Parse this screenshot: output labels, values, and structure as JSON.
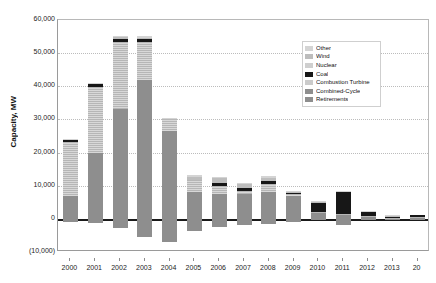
{
  "chart_data": {
    "type": "bar",
    "title": "",
    "subtitle": "",
    "xlabel": "",
    "ylabel": "Capacity, MW",
    "stacked": true,
    "grid": true,
    "legend_position": "top-right",
    "ylim": [
      -10000,
      60000
    ],
    "yticks": [
      60000,
      50000,
      40000,
      30000,
      20000,
      10000,
      0,
      -10000
    ],
    "ytick_labels": [
      "60,000",
      "50,000",
      "40,000",
      "30,000",
      "20,000",
      "10,000",
      "0",
      "(10,000)"
    ],
    "categories": [
      "2000",
      "2001",
      "2002",
      "2003",
      "2004",
      "2005",
      "2006",
      "2007",
      "2008",
      "2009",
      "2010",
      "2011",
      "2012",
      "2013",
      "20"
    ],
    "series": [
      {
        "name": "Combined-Cycle",
        "color": "#8e8e8e",
        "values": [
          7000,
          19800,
          33000,
          42000,
          26500,
          8200,
          7600,
          7400,
          8200,
          7000,
          1800,
          1200,
          700,
          300,
          400
        ]
      },
      {
        "name": "Combustion Turbine",
        "color": "#cbcbcb",
        "values": [
          16200,
          20000,
          20300,
          11300,
          3700,
          3400,
          2400,
          1100,
          2200,
          400,
          300,
          200,
          100,
          50,
          200
        ]
      },
      {
        "name": "Coal",
        "color": "#171717",
        "values": [
          500,
          900,
          900,
          900,
          0,
          0,
          900,
          900,
          1000,
          400,
          2800,
          6900,
          1400,
          600,
          500
        ]
      },
      {
        "name": "Nuclear",
        "color": "#cfcfcf",
        "values": [
          0,
          0,
          0,
          0,
          0,
          0,
          0,
          0,
          0,
          0,
          0,
          0,
          0,
          0,
          0
        ]
      },
      {
        "name": "Wind",
        "color": "#bdbdbd",
        "values": [
          0,
          0,
          600,
          500,
          0,
          1000,
          1300,
          1200,
          1000,
          400,
          200,
          100,
          50,
          50,
          0
        ]
      },
      {
        "name": "Other",
        "color": "#d4d4d4",
        "values": [
          300,
          400,
          500,
          600,
          300,
          500,
          400,
          300,
          400,
          300,
          200,
          100,
          50,
          50,
          0
        ]
      },
      {
        "name": "Retirements",
        "color": "#8e8e8e",
        "values": [
          -1100,
          -1400,
          -2900,
          -5600,
          -6900,
          -3800,
          -2400,
          -1900,
          -1500,
          -1100,
          -300,
          -1800,
          -300,
          -200,
          -100
        ]
      }
    ],
    "legend_entries": [
      {
        "label": "Other",
        "color": "#d4d4d4"
      },
      {
        "label": "Wind",
        "color": "#bdbdbd"
      },
      {
        "label": "Nuclear",
        "color": "#cfcfcf"
      },
      {
        "label": "Coal",
        "color": "#171717"
      },
      {
        "label": "Combustion Turbine",
        "color": "#cbcbcb"
      },
      {
        "label": "Combined-Cycle",
        "color": "#8e8e8e"
      },
      {
        "label": "Retirements",
        "color": "#8e8e8e"
      }
    ]
  }
}
